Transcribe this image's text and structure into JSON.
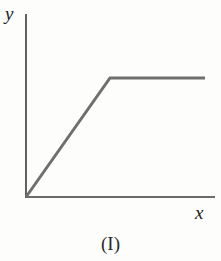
{
  "figure": {
    "caption": "(I)",
    "background_color": "#fdfdfc",
    "axis_color": "#3a3a3a",
    "curve_color": "#6f6f6f",
    "label_color": "#222222",
    "y_axis_label": "y",
    "x_axis_label": "x"
  },
  "chart_data": {
    "type": "line",
    "title": "(I)",
    "xlabel": "x",
    "ylabel": "y",
    "grid": false,
    "legend": null,
    "axis_style": "open-corner-origin",
    "series": [
      {
        "name": "piecewise-linear",
        "color": "#6f6f6f",
        "line_width": 3,
        "x": [
          0,
          0.46,
          1.0
        ],
        "y": [
          0,
          0.65,
          0.65
        ],
        "points_px": [
          {
            "x": 26,
            "y": 197
          },
          {
            "x": 110,
            "y": 78
          },
          {
            "x": 205,
            "y": 78
          }
        ]
      }
    ],
    "xlim": [
      0,
      1.0
    ],
    "ylim": [
      0,
      1.0
    ],
    "xticks": [],
    "yticks": [],
    "axes_px": {
      "origin": {
        "x": 26,
        "y": 197
      },
      "y_axis_top": {
        "x": 26,
        "y": 14
      },
      "x_axis_right": {
        "x": 215,
        "y": 197
      }
    }
  }
}
